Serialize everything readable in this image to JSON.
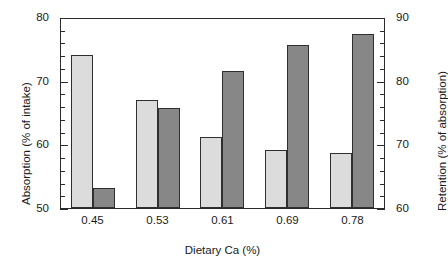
{
  "chart_data": {
    "type": "bar",
    "title": "",
    "xlabel": "Dietary Ca (%)",
    "ylabel": "Absorption (% of intake)",
    "y2label": "Retention (% of absorption)",
    "categories": [
      "0.45",
      "0.53",
      "0.61",
      "0.69",
      "0.78"
    ],
    "ylim": [
      50,
      80
    ],
    "y2lim": [
      60,
      90
    ],
    "yticks": [
      "50",
      "60",
      "70",
      "80"
    ],
    "y2ticks": [
      "60",
      "70",
      "80",
      "90"
    ],
    "ytick_minor_step": 2,
    "grid": false,
    "legend": "none",
    "series": [
      {
        "name": "Absorption (% of intake)",
        "axis": "left",
        "color": "#dcdcdc",
        "values": [
          74.1,
          67.0,
          61.2,
          59.1,
          58.6
        ]
      },
      {
        "name": "Retention (% of absorption)",
        "axis": "right",
        "color": "#878787",
        "values": [
          63.2,
          75.7,
          81.5,
          85.6,
          87.3
        ]
      }
    ]
  },
  "colors": {
    "absorption_bar": "#dcdcdc",
    "retention_bar": "#878787",
    "axis": "#2b2b2b",
    "text": "#1a1a1a",
    "background": "#ffffff"
  }
}
